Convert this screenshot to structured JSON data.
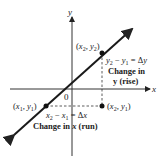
{
  "axes": {
    "x_label": "x",
    "y_label": "y",
    "origin_label": "0"
  },
  "points": {
    "p1": {
      "label_x": "x",
      "label_y": "y",
      "sub": "1",
      "text": "(x1, y1)"
    },
    "p2": {
      "label_x": "x",
      "label_y": "y",
      "sub": "2",
      "text": "(x2, y2)"
    },
    "p3": {
      "text": "(x2, y1)"
    }
  },
  "annotations": {
    "rise_eq": "y2 − y1 = Δy",
    "rise_line1": "Change in",
    "rise_line2": "y (rise)",
    "run_eq": "x2 − x1 = Δx",
    "run_line1": "Change in x (run)"
  },
  "colors": {
    "line": "#1a1a1a",
    "axis": "#2a2a2a",
    "text": "#222222"
  }
}
